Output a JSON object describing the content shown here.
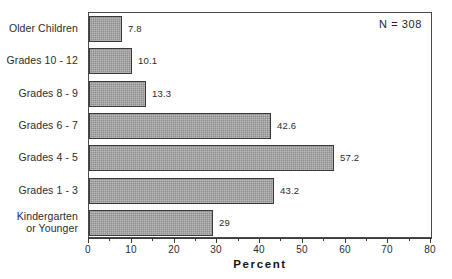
{
  "chart_data": {
    "type": "bar",
    "orientation": "horizontal",
    "title": "",
    "xlabel": "Percent",
    "ylabel": "",
    "xlim": [
      0,
      80
    ],
    "xticks": [
      0,
      10,
      20,
      30,
      40,
      50,
      60,
      70,
      80
    ],
    "minor_tick_step": 5,
    "grid": false,
    "legend": null,
    "categories": [
      "Older Children",
      "Grades 10 - 12",
      "Grades 8 - 9",
      "Grades 6 - 7",
      "Grades 4 - 5",
      "Grades 1 - 3",
      "Kindergarten\nor Younger"
    ],
    "values": [
      7.8,
      10.1,
      13.3,
      42.6,
      57.2,
      43.2,
      29
    ],
    "value_labels": [
      "7.8",
      "10.1",
      "13.3",
      "42.6",
      "57.2",
      "43.2",
      "29"
    ],
    "annotations": [
      {
        "text": "N = 308",
        "position": "top-right-inside-frame"
      }
    ],
    "bar_fill_color": "#8d8d8d",
    "bar_border_color": "#3a3a3a",
    "frame_color": "#4a4a4a",
    "background_color": "#ffffff"
  },
  "axis": {
    "title": "Percent",
    "tick_labels": [
      "0",
      "10",
      "20",
      "30",
      "40",
      "50",
      "60",
      "70",
      "80"
    ]
  },
  "annotation": {
    "sample_size": "N = 308"
  }
}
